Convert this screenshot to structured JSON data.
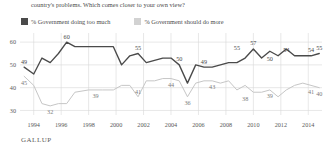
{
  "header": {
    "subtitle": "country's problems. Which comes closer to your own view?"
  },
  "legend": {
    "items": [
      {
        "label": "% Government doing too much",
        "color": "#4a4a4a",
        "key": "too_much"
      },
      {
        "label": "% Government should do more",
        "color": "#d2d2d2",
        "key": "should_do_more"
      }
    ]
  },
  "source": {
    "label": "GALLUP"
  },
  "chart_data": {
    "type": "line",
    "title": "",
    "subtitle": "country's problems. Which comes closer to your own view?",
    "xlabel": "",
    "ylabel": "",
    "xlim": [
      1993,
      2015
    ],
    "ylim": [
      28,
      64
    ],
    "yticks": [
      30,
      40,
      50,
      60
    ],
    "ytick_labels": [
      "30",
      "40",
      "50",
      "60"
    ],
    "xticks": [
      1994,
      1996,
      1998,
      2000,
      2002,
      2004,
      2006,
      2008,
      2010,
      2012,
      2014
    ],
    "xtick_labels": [
      "1994",
      "1996",
      "1998",
      "2000",
      "2002",
      "2004",
      "2006",
      "2008",
      "2010",
      "2012",
      "2014"
    ],
    "grid": true,
    "grid_axis": "both",
    "legend_position": "top-left",
    "series": [
      {
        "name": "% Government doing too much",
        "color": "#4a4a4a",
        "x": [
          1993.3,
          1994.0,
          1994.6,
          1995.2,
          1995.8,
          1996.4,
          1997.0,
          1998.0,
          1999.0,
          1999.8,
          2000.4,
          2001.0,
          2001.6,
          2002.2,
          2002.8,
          2003.4,
          2004.0,
          2004.6,
          2005.2,
          2005.8,
          2006.4,
          2007.0,
          2007.6,
          2008.2,
          2008.8,
          2009.4,
          2010.0,
          2010.6,
          2011.2,
          2011.8,
          2012.4,
          2013.0,
          2013.6,
          2014.2,
          2014.8
        ],
        "values": [
          49,
          46,
          53,
          51,
          55,
          60,
          58,
          58,
          58,
          58,
          50,
          54,
          55,
          51,
          52,
          53,
          53,
          50,
          42,
          50,
          49,
          49,
          50,
          51,
          51,
          53,
          57,
          53,
          56,
          54,
          57,
          54,
          54,
          54,
          55
        ],
        "labels": [
          {
            "x": 1993.3,
            "value": 49,
            "text": "49"
          },
          {
            "x": 1996.4,
            "value": 60,
            "text": "60"
          },
          {
            "x": 2001.6,
            "value": 55,
            "text": "55"
          },
          {
            "x": 2004.6,
            "value": 50,
            "text": "50"
          },
          {
            "x": 2006.4,
            "value": 49,
            "text": "49"
          },
          {
            "x": 2008.8,
            "value": 55,
            "text": "55"
          },
          {
            "x": 2010.0,
            "value": 57,
            "text": "57"
          },
          {
            "x": 2011.2,
            "value": 50,
            "text": "50"
          },
          {
            "x": 2012.4,
            "value": 54,
            "text": "54"
          },
          {
            "x": 2014.2,
            "value": 54,
            "text": "54"
          },
          {
            "x": 2014.8,
            "value": 55,
            "text": "55"
          }
        ]
      },
      {
        "name": "% Government should do more",
        "color": "#c6c6c6",
        "x": [
          1993.3,
          1994.0,
          1994.6,
          1995.2,
          1995.8,
          1996.4,
          1997.0,
          1998.0,
          1999.0,
          1999.8,
          2000.4,
          2001.0,
          2001.6,
          2002.2,
          2002.8,
          2003.4,
          2004.0,
          2004.6,
          2005.2,
          2005.8,
          2006.4,
          2007.0,
          2007.6,
          2008.2,
          2008.8,
          2009.4,
          2010.0,
          2010.6,
          2011.2,
          2011.8,
          2012.4,
          2013.0,
          2013.6,
          2014.2,
          2014.8
        ],
        "values": [
          45,
          41,
          33,
          32,
          33,
          33,
          38,
          39,
          39,
          39,
          41,
          41,
          36,
          43,
          43,
          44,
          44,
          43,
          36,
          42,
          43,
          43,
          42,
          43,
          39,
          41,
          38,
          38,
          39,
          36,
          39,
          41,
          42,
          41,
          40
        ],
        "labels": [
          {
            "x": 1993.3,
            "value": 45,
            "text": "45"
          },
          {
            "x": 1995.2,
            "value": 32,
            "text": "32"
          },
          {
            "x": 1998.5,
            "value": 39,
            "text": "39"
          },
          {
            "x": 2001.6,
            "value": 41,
            "text": "41"
          },
          {
            "x": 2005.2,
            "value": 36,
            "text": "36"
          },
          {
            "x": 2004.0,
            "value": 44,
            "text": "44"
          },
          {
            "x": 2007.0,
            "value": 43,
            "text": "43"
          },
          {
            "x": 2009.4,
            "value": 38,
            "text": "38"
          },
          {
            "x": 2011.2,
            "value": 39,
            "text": "39"
          },
          {
            "x": 2014.2,
            "value": 41,
            "text": "41"
          },
          {
            "x": 2014.8,
            "value": 40,
            "text": "40"
          }
        ]
      }
    ]
  }
}
